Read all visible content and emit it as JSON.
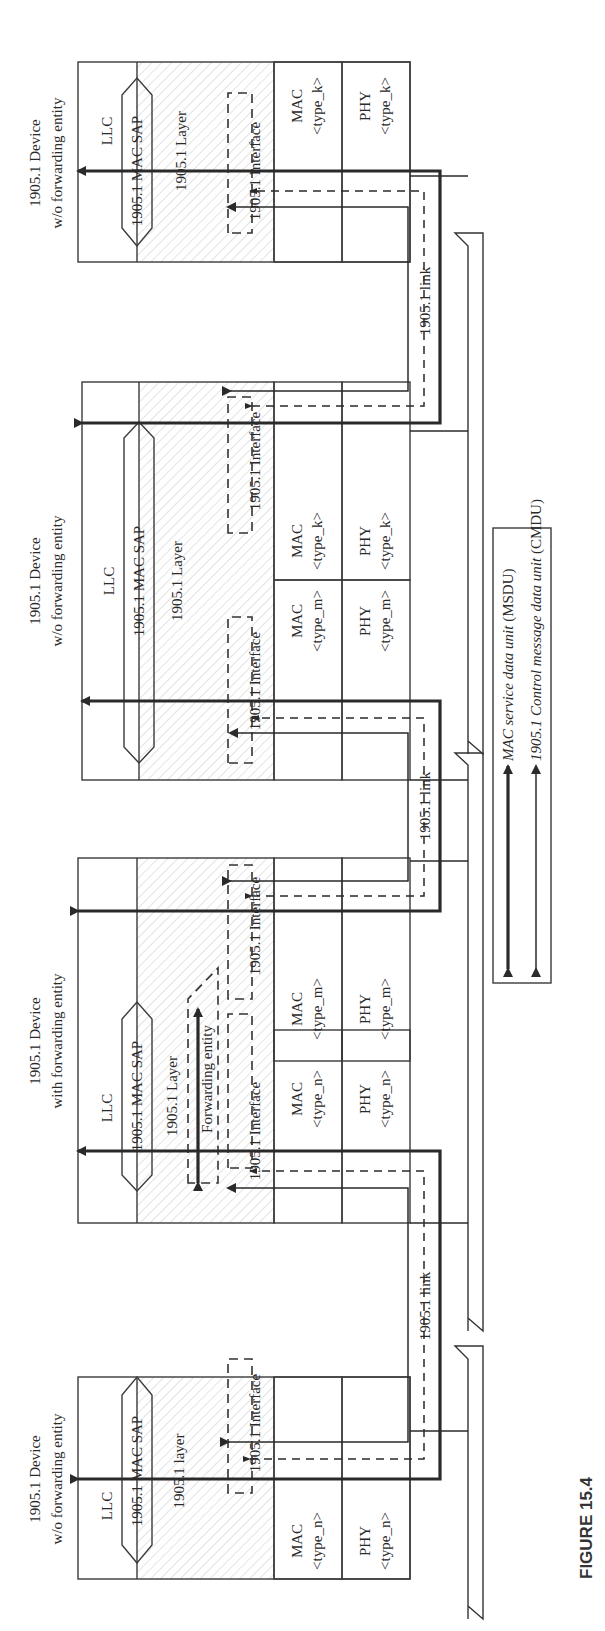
{
  "figure": {
    "caption": "FIGURE 15.4",
    "orientation": "rotated 90 degrees counter-clockwise"
  },
  "devices": [
    {
      "title_line1": "1905.1 Device",
      "title_line2": "w/o forwarding entity",
      "llc": "LLC",
      "sap": "1905.1 MAC SAP",
      "layer": "1905.1 layer",
      "interfaces": [
        {
          "label": "1905.1 Interface",
          "mac": "MAC",
          "phy": "PHY",
          "type": "<type_n>",
          "pattern": "dots"
        }
      ]
    },
    {
      "title_line1": "1905.1 Device",
      "title_line2": "with forwarding entity",
      "llc": "LLC",
      "sap": "1905.1 MAC SAP",
      "layer": "1905.1 Layer",
      "forwarding": "Forwarding entity",
      "interfaces": [
        {
          "label": "1905.1 Interface",
          "mac": "MAC",
          "phy": "PHY",
          "type": "<type_n>",
          "pattern": "dots"
        },
        {
          "label": "1905.1 Interface",
          "mac": "MAC",
          "phy": "PHY",
          "type": "<type_m>",
          "pattern": "hlines"
        }
      ]
    },
    {
      "title_line1": "1905.1 Device",
      "title_line2": "w/o forwarding entity",
      "llc": "LLC",
      "sap": "1905.1 MAC SAP",
      "layer": "1905.1 Layer",
      "interfaces": [
        {
          "label": "1905.1 Interface",
          "mac": "MAC",
          "phy": "PHY",
          "type": "<type_m>",
          "pattern": "hlines"
        },
        {
          "label": "1905.1 Interface",
          "mac": "MAC",
          "phy": "PHY",
          "type": "<type_k>",
          "pattern": "grid"
        }
      ]
    },
    {
      "title_line1": "1905.1 Device",
      "title_line2": "w/o forwarding entity",
      "llc": "LLC",
      "sap": "1905.1 MAC SAP",
      "layer": "1905.1 Layer",
      "interfaces": [
        {
          "label": "1905.1 Interface",
          "mac": "MAC",
          "phy": "PHY",
          "type": "<type_k>",
          "pattern": "grid"
        }
      ]
    }
  ],
  "links": [
    {
      "label": "1905.1 link"
    },
    {
      "label": "1905.1 link"
    },
    {
      "label": "1905.1 link"
    }
  ],
  "legend": {
    "msdu": {
      "italic": "MAC service data unit",
      "suffix": " (MSDU)"
    },
    "cmdu": {
      "italic": "1905.1 Control message data unit",
      "suffix": " (CMDU)"
    }
  },
  "colors": {
    "line": "#2a2a2a",
    "hatch": "#d6d6d6",
    "dots": "#bdbdbd",
    "background": "#ffffff"
  }
}
